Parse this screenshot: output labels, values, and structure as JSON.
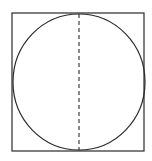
{
  "diagram": {
    "stroke_color": "#2a2a2a",
    "background": "#ffffff",
    "square": {
      "x": 12,
      "y": 13,
      "width": 132,
      "height": 138
    },
    "circle": {
      "cx": 79,
      "cy": 82,
      "rx": 66,
      "ry": 68
    },
    "diameter": {
      "x": 79,
      "y1": 14,
      "y2": 150,
      "style": "dashed"
    }
  }
}
